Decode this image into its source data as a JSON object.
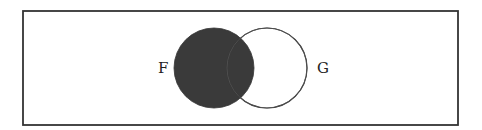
{
  "diagram": {
    "type": "venn",
    "frame": {
      "x": 23,
      "y": 11,
      "width": 435,
      "height": 114,
      "stroke": "#333333",
      "stroke_width": 1.8
    },
    "sets": [
      {
        "name": "F",
        "label": "F",
        "cx": 214,
        "cy": 68,
        "r": 40,
        "filled": true,
        "fill": "#3a3a3a",
        "stroke": "#333333",
        "label_x": 158,
        "label_y": 73
      },
      {
        "name": "G",
        "label": "G",
        "cx": 267,
        "cy": 68,
        "r": 40,
        "filled": false,
        "fill": "none",
        "stroke": "#333333",
        "label_x": 317,
        "label_y": 73
      }
    ],
    "shaded_region": "F"
  }
}
